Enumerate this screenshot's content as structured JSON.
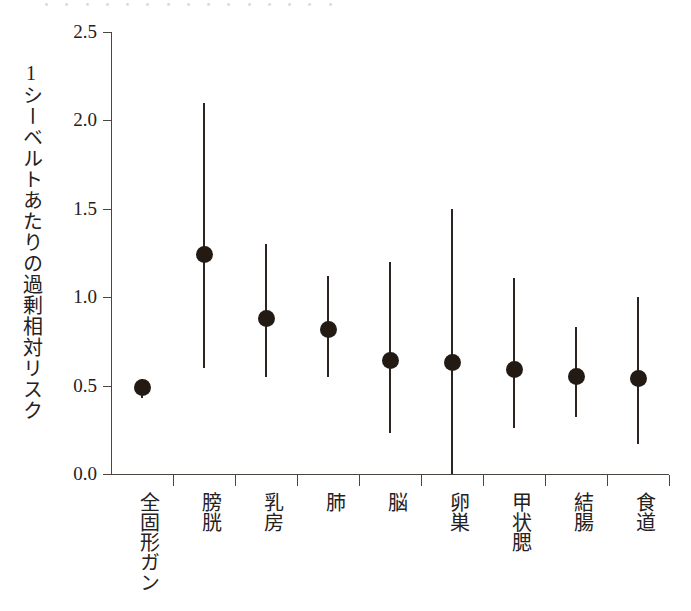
{
  "figure": {
    "background_color": "#ffffff",
    "ink_color": "#25211d",
    "marker_color": "#241a14",
    "axis_color": "#4a4540",
    "top_cut_text": "・ ・      ・ ・ ・            ・ ・ ・                ・ ・   ・    ・ ・ ・ ・"
  },
  "chart_data": {
    "type": "scatter",
    "title": "",
    "subtitle": "",
    "xlabel": "",
    "ylabel": "1シーベルトあたりの過剰相対リスク",
    "ylim": [
      0.0,
      2.5
    ],
    "yticks": [
      0.0,
      0.5,
      1.0,
      1.5,
      2.0,
      2.5
    ],
    "ytick_labels": [
      "0.0",
      "0.5",
      "1.0",
      "1.5",
      "2.0",
      "2.5"
    ],
    "grid": false,
    "legend": null,
    "error_bars": "vertical (95% confidence interval)",
    "categories": [
      "全固形ガン",
      "膀胱",
      "乳房",
      "肺",
      "脳",
      "卵巣",
      "甲状腮",
      "結腸",
      "食道"
    ],
    "values": [
      0.49,
      1.24,
      0.88,
      0.82,
      0.64,
      0.63,
      0.59,
      0.55,
      0.54
    ],
    "err_low": [
      0.43,
      0.6,
      0.55,
      0.55,
      0.23,
      0.0,
      0.26,
      0.32,
      0.17
    ],
    "err_high": [
      0.54,
      2.1,
      1.3,
      1.12,
      1.2,
      1.5,
      1.11,
      0.83,
      1.0
    ],
    "points": [
      {
        "category": "全固形ガン",
        "value": 0.49,
        "low": 0.43,
        "high": 0.54
      },
      {
        "category": "膀胱",
        "value": 1.24,
        "low": 0.6,
        "high": 2.1
      },
      {
        "category": "乳房",
        "value": 0.88,
        "low": 0.55,
        "high": 1.3
      },
      {
        "category": "肺",
        "value": 0.82,
        "low": 0.55,
        "high": 1.12
      },
      {
        "category": "脳",
        "value": 0.64,
        "low": 0.23,
        "high": 1.2
      },
      {
        "category": "卵巣",
        "value": 0.63,
        "low": 0.0,
        "high": 1.5
      },
      {
        "category": "甲状腮",
        "value": 0.59,
        "low": 0.26,
        "high": 1.11
      },
      {
        "category": "結腸",
        "value": 0.55,
        "low": 0.32,
        "high": 0.83
      },
      {
        "category": "食道",
        "value": 0.54,
        "low": 0.17,
        "high": 1.0
      }
    ]
  }
}
